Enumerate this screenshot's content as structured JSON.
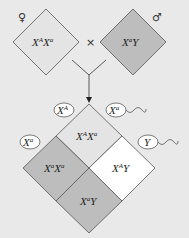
{
  "parents": {
    "female": {
      "symbol": "♀",
      "genotype_base": "X",
      "sup1": "A",
      "mid": "X",
      "sup2": "a",
      "color": "#e4e4e4"
    },
    "cross": "×",
    "male": {
      "symbol": "♂",
      "genotype_base": "X",
      "sup1": "a",
      "tail": "Y",
      "color": "#bdbdbd"
    }
  },
  "gametes": {
    "egg1": {
      "base": "X",
      "sup": "A"
    },
    "egg2": {
      "base": "X",
      "sup": "a"
    },
    "sperm1": {
      "base": "X",
      "sup": "a"
    },
    "sperm2": {
      "base": "Y"
    }
  },
  "offspring": {
    "top": {
      "b1": "X",
      "s1": "A",
      "b2": "X",
      "s2": "a",
      "color": "#e4e4e4"
    },
    "left": {
      "b1": "X",
      "s1": "a",
      "b2": "X",
      "s2": "a",
      "color": "#bdbdbd"
    },
    "right": {
      "b1": "X",
      "s1": "A",
      "b2": "Y",
      "color": "#ffffff"
    },
    "bottom": {
      "b1": "X",
      "s1": "a",
      "b2": "Y",
      "color": "#bdbdbd"
    }
  }
}
